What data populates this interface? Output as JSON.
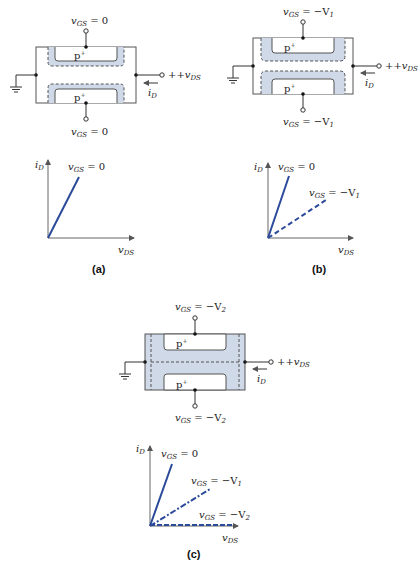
{
  "figure": {
    "panels": [
      {
        "id": "a",
        "caption": "(a)",
        "gate_top_label": "v_GS = 0",
        "gate_top_main": "v",
        "gate_top_sub": "GS",
        "gate_top_value": " = 0",
        "gate_bottom_main": "v",
        "gate_bottom_sub": "GS",
        "gate_bottom_value": " = 0",
        "region_label": "p",
        "region_sup": "+",
        "drain_label_main": "+v",
        "drain_label_sub": "DS",
        "current_main": "i",
        "current_sub": "D",
        "depletion": "thin"
      },
      {
        "id": "b",
        "caption": "(b)",
        "gate_top_main": "v",
        "gate_top_sub": "GS",
        "gate_top_value": " = −V",
        "gate_top_value_sub": "1",
        "gate_bottom_main": "v",
        "gate_bottom_sub": "GS",
        "gate_bottom_value": " = −V",
        "gate_bottom_value_sub": "1",
        "region_label": "p",
        "region_sup": "+",
        "drain_label_main": "+v",
        "drain_label_sub": "DS",
        "current_main": "i",
        "current_sub": "D",
        "depletion": "medium"
      },
      {
        "id": "c",
        "caption": "(c)",
        "gate_top_main": "v",
        "gate_top_sub": "GS",
        "gate_top_value": " = −V",
        "gate_top_value_sub": "2",
        "gate_bottom_main": "v",
        "gate_bottom_sub": "GS",
        "gate_bottom_value": " = −V",
        "gate_bottom_value_sub": "2",
        "region_label": "p",
        "region_sup": "+",
        "drain_label_main": "+v",
        "drain_label_sub": "DS",
        "current_main": "i",
        "current_sub": "D",
        "depletion": "pinched-off"
      }
    ],
    "graphs": [
      {
        "id": "a",
        "ylabel_main": "i",
        "ylabel_sub": "D",
        "xlabel_main": "v",
        "xlabel_sub": "DS",
        "curves": [
          {
            "label_main": "v",
            "label_sub": "GS",
            "label_value": " = 0",
            "style": "solid"
          }
        ]
      },
      {
        "id": "b",
        "ylabel_main": "i",
        "ylabel_sub": "D",
        "xlabel_main": "v",
        "xlabel_sub": "DS",
        "curves": [
          {
            "label_main": "v",
            "label_sub": "GS",
            "label_value": " = 0",
            "style": "solid"
          },
          {
            "label_main": "v",
            "label_sub": "GS",
            "label_value": " = −V",
            "label_value_sub": "1",
            "style": "dashed"
          }
        ]
      },
      {
        "id": "c",
        "ylabel_main": "i",
        "ylabel_sub": "D",
        "xlabel_main": "v",
        "xlabel_sub": "DS",
        "curves": [
          {
            "label_main": "v",
            "label_sub": "GS",
            "label_value": " = 0",
            "style": "solid"
          },
          {
            "label_main": "v",
            "label_sub": "GS",
            "label_value": " = −V",
            "label_value_sub": "1",
            "style": "dash-dot"
          },
          {
            "label_main": "v",
            "label_sub": "GS",
            "label_value": " = −V",
            "label_value_sub": "2",
            "style": "dashed"
          }
        ]
      }
    ],
    "colors": {
      "line": "#2b4a9a",
      "depletion_fill": "#cfd9e8",
      "outline": "#555555",
      "axis": "#666666"
    }
  }
}
